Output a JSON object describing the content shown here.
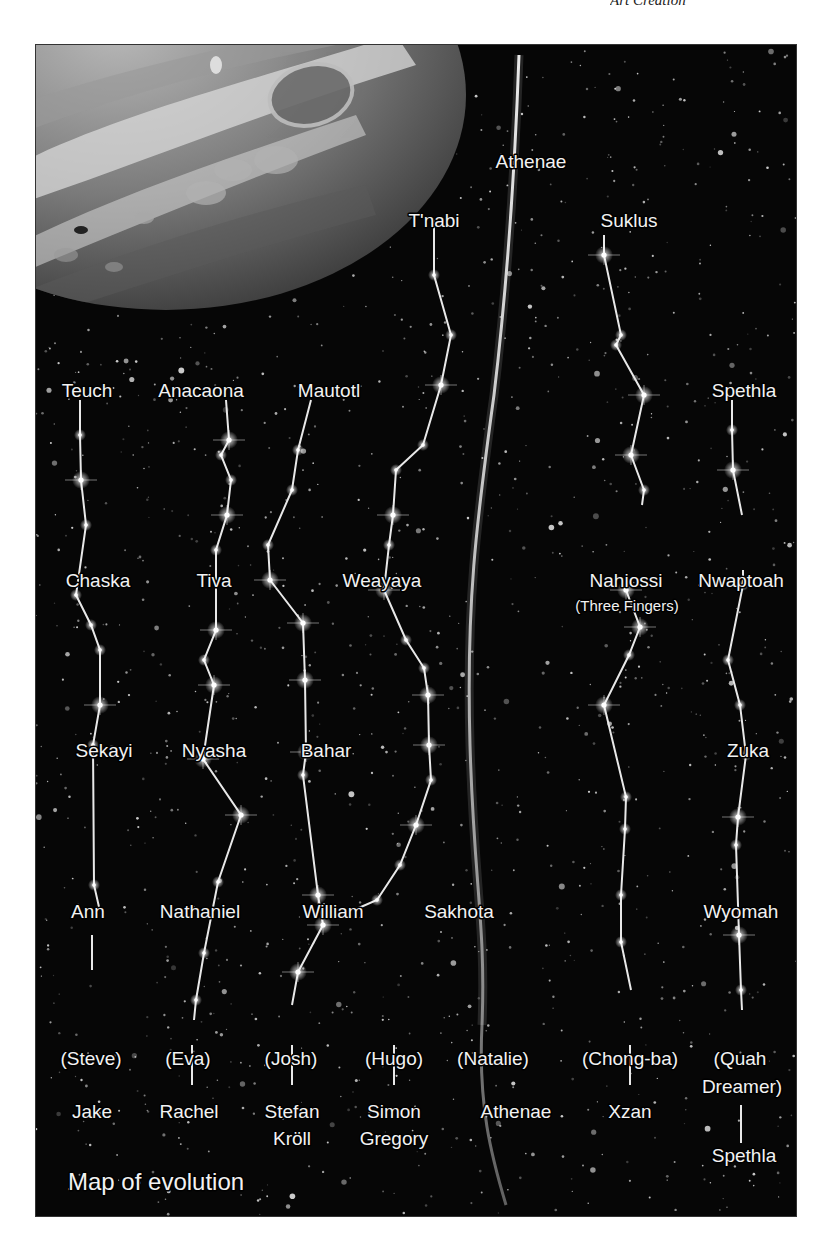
{
  "page_header": {
    "title": "Art Creation",
    "page_number": ""
  },
  "figure": {
    "caption": "Map of evolution",
    "background_color": "#060606",
    "line_color": "#e8e8e8",
    "planet": {
      "name": "Jupiter"
    },
    "central_stream": {
      "top_label": "Athenae",
      "natalie_label": "(Natalie)",
      "bottom_label": "Athenae"
    },
    "chains": [
      {
        "id": "teuch",
        "labels": [
          "Teuch",
          "Chaska",
          "Sekayi",
          "Ann",
          "(Steve)",
          "Jake"
        ]
      },
      {
        "id": "anacaona",
        "labels": [
          "Anacaona",
          "Tiva",
          "Nyasha",
          "Nathaniel",
          "(Eva)",
          "Rachel"
        ]
      },
      {
        "id": "mautotl",
        "labels": [
          "Mautotl",
          "Bahar",
          "William",
          "(Josh)",
          "Stefan",
          "Kröll"
        ]
      },
      {
        "id": "tnabi",
        "labels": [
          "T'nabi",
          "Weayaya",
          "Sakhota",
          "(Hugo)",
          "Simon",
          "Gregory"
        ]
      },
      {
        "id": "suklus",
        "labels": [
          "Suklus",
          "Nahiossi",
          "(Three Fingers)",
          "(Chong-ba)",
          "Xzan"
        ]
      },
      {
        "id": "spethla",
        "labels": [
          "Spethla",
          "Nwaptoah",
          "Zuka",
          "Wyomah",
          "(Quah",
          "Dreamer)",
          "Spethla"
        ]
      }
    ]
  }
}
